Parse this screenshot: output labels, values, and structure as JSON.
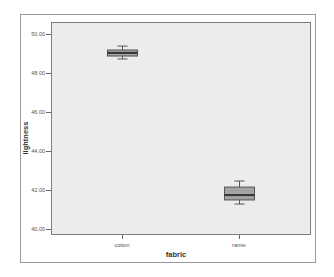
{
  "chart_data": {
    "type": "boxplot",
    "title": "",
    "xlabel": "fabric",
    "ylabel": "lightness",
    "categories": [
      "cotton",
      "ramie"
    ],
    "ylim": [
      39.7,
      50.6
    ],
    "yticks": [
      "40.00",
      "42.00",
      "44.00",
      "46.00",
      "48.00",
      "50.00"
    ],
    "grid": false,
    "legend": null,
    "series": [
      {
        "name": "cotton",
        "whisker_low": 48.72,
        "q1": 48.87,
        "median": 49.03,
        "q3": 49.18,
        "whisker_high": 49.38
      },
      {
        "name": "ramie",
        "whisker_low": 41.28,
        "q1": 41.49,
        "median": 41.74,
        "q3": 42.15,
        "whisker_high": 42.46
      }
    ],
    "colors": {
      "plot_background": "#ececec",
      "box_fill": "#a3a3a3",
      "box_stroke": "#555555",
      "median": "#333333"
    }
  },
  "axis": {
    "y_labels": [
      "50.00",
      "48.00",
      "46.00",
      "44.00",
      "42.00",
      "40.00"
    ],
    "x_labels": [
      "cotton",
      "ramie"
    ],
    "xlabel": "fabric",
    "ylabel": "lightness"
  }
}
